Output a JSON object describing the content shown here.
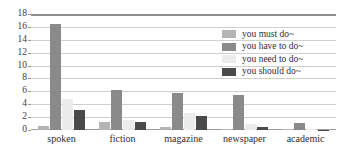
{
  "chart_data": {
    "type": "bar",
    "title": "",
    "xlabel": "",
    "ylabel": "",
    "categories": [
      "spoken",
      "fiction",
      "magazine",
      "newspaper",
      "academic"
    ],
    "series": [
      {
        "name": "you must do~",
        "color": "#b5b5b5",
        "values": [
          0.6,
          1.25,
          0.4,
          0.1,
          0.2
        ]
      },
      {
        "name": "you have to do~",
        "color": "#8a8a8a",
        "values": [
          16.5,
          6.2,
          5.8,
          5.4,
          1.1
        ]
      },
      {
        "name": "you need to do~",
        "color": "#ececec",
        "values": [
          4.75,
          1.5,
          2.6,
          0.9,
          0.12
        ]
      },
      {
        "name": "you should do~",
        "color": "#4a4a4a",
        "values": [
          3.1,
          1.3,
          2.1,
          0.45,
          0.05
        ]
      }
    ],
    "ylim": [
      0,
      18
    ],
    "ytick_step": 2,
    "yticks": [
      0,
      2,
      4,
      6,
      8,
      10,
      12,
      14,
      16,
      18
    ],
    "grid": true,
    "legend_position": "top-right",
    "bar_group_mode": "grouped"
  },
  "legend": {
    "entries": [
      {
        "label": "you must do~"
      },
      {
        "label": "you have to do~"
      },
      {
        "label": "you need to do~"
      },
      {
        "label": "you should do~"
      }
    ]
  }
}
